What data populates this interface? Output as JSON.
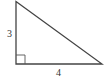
{
  "diagram": {
    "type": "right-triangle",
    "vertices": {
      "top": [
        16,
        1.5
      ],
      "bottom_left": [
        16,
        64
      ],
      "bottom_right": [
        102,
        64
      ]
    },
    "labels": {
      "vertical_leg": "3",
      "horizontal_leg": "4"
    },
    "right_angle_marker": true,
    "stroke_color": "#444444",
    "background": "#ffffff"
  }
}
